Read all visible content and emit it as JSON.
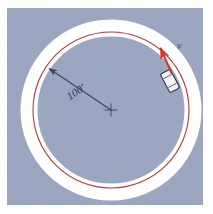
{
  "figure": {
    "panel": {
      "background_color": "#9aa5c0",
      "border_color": "#ffffff",
      "x": 7,
      "y": 8,
      "width": 196,
      "height": 197
    },
    "track": {
      "band_color": "#ffffff",
      "center_x": 111,
      "center_y": 110,
      "band_radius": 82,
      "band_width": 17,
      "path_color": "#a52b22",
      "path_radius": 78,
      "path_width": 1.1
    },
    "center_mark": {
      "name": "center-cross",
      "x": 111,
      "y": 110,
      "size": 7,
      "color": "#3c4266"
    },
    "radius_dimension": {
      "label": "100'",
      "value": 100,
      "unit": "ft",
      "line_color": "#3c4266",
      "from_x": 111,
      "from_y": 110,
      "to_x": 46,
      "to_y": 66,
      "label_x": 78,
      "label_y": 92,
      "label_rotation": -34
    },
    "car": {
      "name": "car",
      "x": 170,
      "y": 80,
      "width": 10,
      "height": 21,
      "rotation": -28,
      "body_color": "#f2f2f4",
      "outline_color": "#2e3250"
    },
    "velocity_vector": {
      "label": "v",
      "color": "#d8342a",
      "tail_x": 171,
      "tail_y": 74,
      "tip_x": 160,
      "tip_y": 47,
      "label_x": 177,
      "label_y": 48
    }
  }
}
